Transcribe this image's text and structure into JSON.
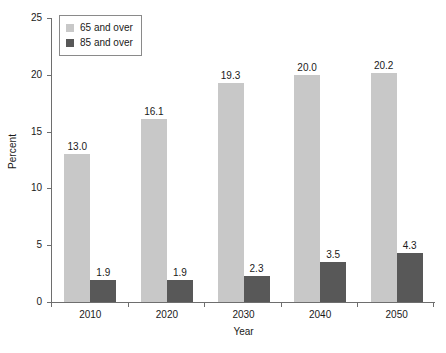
{
  "chart_data": {
    "type": "bar",
    "title": "",
    "subtitle": "",
    "xlabel": "Year",
    "ylabel": "Percent",
    "categories": [
      "2010",
      "2020",
      "2030",
      "2040",
      "2050"
    ],
    "series": [
      {
        "name": "65 and over",
        "color": "#c8c8c8",
        "values": [
          13.0,
          16.1,
          19.3,
          20.0,
          20.2
        ],
        "labels": [
          "13.0",
          "16.1",
          "19.3",
          "20.0",
          "20.2"
        ]
      },
      {
        "name": "85 and over",
        "color": "#585858",
        "values": [
          1.9,
          1.9,
          2.3,
          3.5,
          4.3
        ],
        "labels": [
          "1.9",
          "1.9",
          "2.3",
          "3.5",
          "4.3"
        ]
      }
    ],
    "ylim": [
      0,
      25
    ],
    "yticks": [
      0,
      5,
      10,
      15,
      20,
      25
    ],
    "ytick_labels": [
      "0",
      "5",
      "10",
      "15",
      "20",
      "25"
    ],
    "xtick_labels": [
      "2010",
      "2020",
      "2030",
      "2040",
      "2050"
    ],
    "grid": false,
    "legend_position": "upper left",
    "legend_entries": [
      "65 and over",
      "85 and over"
    ],
    "data_labels_shown": true
  }
}
